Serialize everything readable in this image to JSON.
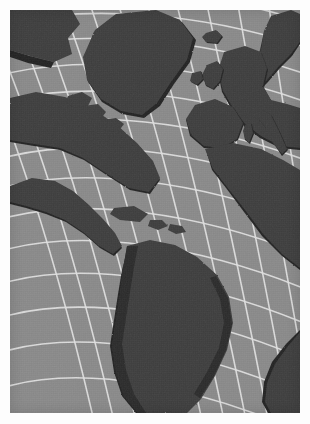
{
  "figure": {
    "kind": "map-plate",
    "title": "",
    "caption": "",
    "page_background": "#fdfdfd",
    "margin_px": 10
  },
  "map": {
    "name": "north-atlantic-world-map",
    "projection": "curved-graticule (conic/azimuthal style)",
    "region": "North Atlantic Ocean, the Americas, Europe and Africa",
    "style": "grayscale shaded relief outline",
    "colors": {
      "ocean": "#8a8a8a",
      "land": "#3c3c3c",
      "coast_shadow": "#232323",
      "graticule": "#e3e3e3",
      "border": "#ffffff"
    },
    "graticule": {
      "visible": true,
      "line_color": "#e3e3e3",
      "line_width_px": 1.6,
      "approx_cell_px": 24,
      "meridian_count": 16,
      "parallel_count": 18
    },
    "labels": [],
    "legend": {
      "visible": false
    },
    "scale_bar": {
      "visible": false
    },
    "compass_rose": {
      "visible": false
    },
    "landmasses": [
      {
        "name": "greenland",
        "position": "top-center-left"
      },
      {
        "name": "north-america",
        "position": "left"
      },
      {
        "name": "great-lakes",
        "position": "center-left"
      },
      {
        "name": "hudson-bay",
        "position": "top-left"
      },
      {
        "name": "iceland",
        "position": "top-center"
      },
      {
        "name": "british-isles",
        "position": "top-right-center"
      },
      {
        "name": "scandinavia",
        "position": "top-right"
      },
      {
        "name": "europe",
        "position": "right-center"
      },
      {
        "name": "italy",
        "position": "right"
      },
      {
        "name": "sardinia-corsica",
        "position": "right"
      },
      {
        "name": "africa-northwest",
        "position": "right-center"
      },
      {
        "name": "central-america",
        "position": "center-left"
      },
      {
        "name": "caribbean",
        "position": "center"
      },
      {
        "name": "south-america",
        "position": "bottom-center"
      },
      {
        "name": "africa-southwest",
        "position": "bottom-right"
      }
    ]
  }
}
